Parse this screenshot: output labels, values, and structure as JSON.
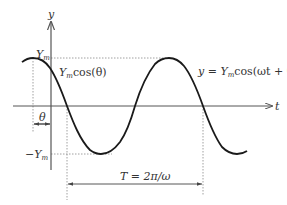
{
  "diagram": {
    "axis_labels": {
      "y": "y",
      "t": "t"
    },
    "labels": {
      "peak": "Y",
      "peak_sub": "m",
      "trough_minus": "−Y",
      "trough_sub": "m",
      "intercept_Y": "Y",
      "intercept_sub": "m",
      "intercept_rest": "cos(θ)",
      "equation_y": "y = Y",
      "equation_sub": "m",
      "equation_rest": "cos(ωt + θ)",
      "phase": "θ",
      "period": "T = 2π/ω"
    },
    "colors": {
      "curve": "#1a1a1a",
      "axis": "#555555",
      "dotted": "#888888",
      "text": "#333333"
    }
  }
}
